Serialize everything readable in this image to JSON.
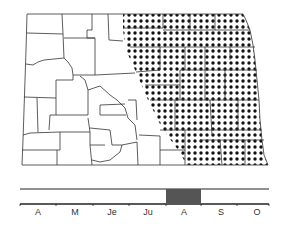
{
  "map": {
    "region": "North Dakota counties",
    "shaded_area_description": "eastern region of the state (dotted pattern)",
    "pattern": "dots",
    "colors": {
      "outline": "#333333",
      "dots": "#111111",
      "background": "#ffffff"
    }
  },
  "timeline": {
    "months": [
      "A",
      "M",
      "Je",
      "Ju",
      "A",
      "S",
      "O"
    ],
    "highlight": {
      "start_month_index": 4,
      "label": "A",
      "color": "#555555"
    }
  }
}
